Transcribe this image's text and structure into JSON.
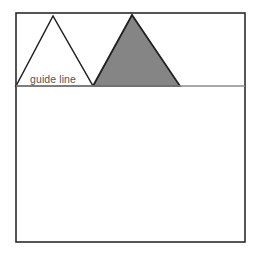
{
  "canvas": {
    "width": 254,
    "height": 254,
    "background_color": "#ffffff"
  },
  "frame": {
    "name": "drawing-frame",
    "x": 16,
    "y": 13,
    "width": 229,
    "height": 229,
    "stroke_color": "#2b2b2b",
    "stroke_width": 1.6,
    "fill_color": "#ffffff"
  },
  "guide_line": {
    "label": "guide line",
    "label_x": 30,
    "label_y": 83,
    "y": 86,
    "x_start": 16,
    "x_end": 245,
    "stroke_color": "#8c8c8c",
    "stroke_width": 1.4,
    "label_color": "#555555"
  },
  "shapes": [
    {
      "name": "triangle-outline-left",
      "kind": "triangle",
      "points": "16,86 53,16 93,86",
      "fill_color": "#ffffff",
      "stroke_color": "#1f1f1f",
      "stroke_width": 1.5,
      "apex_x": 53,
      "apex_y": 16,
      "base_left_x": 16,
      "base_right_x": 93,
      "base_y": 86
    },
    {
      "name": "triangle-filled-right",
      "kind": "triangle",
      "points": "93,86 132,15 180,86",
      "fill_color": "#858585",
      "stroke_color": "#1f1f1f",
      "stroke_width": 1.8,
      "apex_x": 132,
      "apex_y": 15,
      "base_left_x": 93,
      "base_right_x": 180,
      "base_y": 86
    }
  ]
}
